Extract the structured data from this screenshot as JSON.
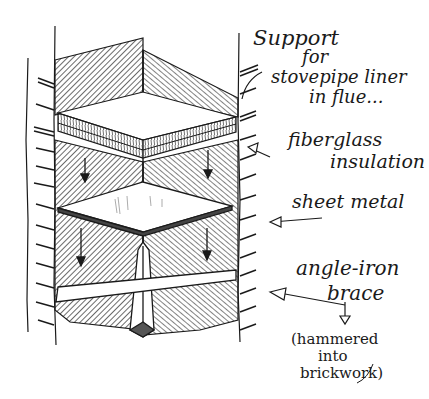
{
  "diagram": {
    "title_lines": [
      "Support",
      "for",
      "stovepipe liner",
      "in flue..."
    ],
    "labels": {
      "insulation": [
        "fiberglass",
        "insulation"
      ],
      "sheet_metal": "sheet metal",
      "brace": [
        "angle-iron",
        "brace"
      ],
      "brace_note": [
        "(hammered",
        "into",
        "brickwork)"
      ]
    },
    "parts": [
      "flue walls (brick)",
      "fiberglass insulation pad",
      "sheet metal plate",
      "angle-iron brace"
    ],
    "colors": {
      "ink": "#1a1a1a",
      "paper": "#ffffff"
    }
  }
}
